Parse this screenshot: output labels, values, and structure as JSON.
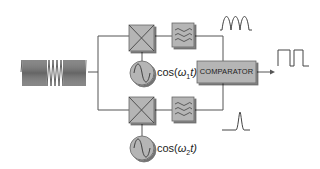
{
  "diagram": {
    "type": "block-diagram",
    "title": "",
    "input": {
      "name": "input-signal",
      "description": "FSK modulated signal (high-low-high frequency burst)"
    },
    "channels": [
      {
        "name": "upper",
        "mixer": "multiplier",
        "oscillator": {
          "label_prefix": "cos(",
          "omega": "ω",
          "sub": "1",
          "label_suffix": "t)"
        },
        "filter": "low-pass filter",
        "output_waveform": "rectified envelope (three humps)"
      },
      {
        "name": "lower",
        "mixer": "multiplier",
        "oscillator": {
          "label_prefix": "cos(",
          "omega": "ω",
          "sub": "2",
          "label_suffix": "t)"
        },
        "filter": "low-pass filter",
        "output_waveform": "single pulse"
      }
    ],
    "comparator": {
      "label": "COMPARATOR"
    },
    "output": {
      "name": "digital-output",
      "description": "square wave (bits)"
    }
  },
  "colors": {
    "block_fill": "#b5b5b5",
    "block_shadow": "#6e6e6e",
    "line": "#555555",
    "waveform": "#444444",
    "background": "#ffffff"
  }
}
